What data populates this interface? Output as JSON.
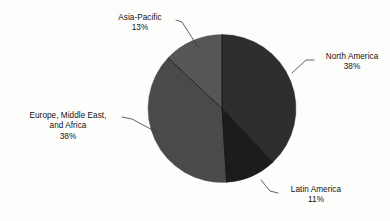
{
  "chart_data": {
    "type": "pie",
    "title": "",
    "subtitle": "",
    "xlabel": "",
    "ylabel": "",
    "legend_position": "none",
    "grid": false,
    "labels_position": "outside-with-leader-lines",
    "start_angle_deg": 0,
    "direction": "clockwise",
    "categories": [
      "North America",
      "Latin America",
      "Europe, Middle East, and Africa",
      "Asia-Pacific"
    ],
    "values": [
      38,
      11,
      38,
      13
    ],
    "value_unit": "%",
    "slices": [
      {
        "name": "North America",
        "label_line_1": "North America",
        "label_line_2": "",
        "value": 38,
        "value_text": "38%",
        "color": "#2e2e2e",
        "start_deg": 0,
        "end_deg": 136.8
      },
      {
        "name": "Latin America",
        "label_line_1": "Latin America",
        "label_line_2": "",
        "value": 11,
        "value_text": "11%",
        "color": "#1c1c1c",
        "start_deg": 136.8,
        "end_deg": 176.4
      },
      {
        "name": "Europe, Middle East, and Africa",
        "label_line_1": "Europe, Middle East,",
        "label_line_2": "and Africa",
        "value": 38,
        "value_text": "38%",
        "color": "#4a4a4a",
        "start_deg": 176.4,
        "end_deg": 313.2
      },
      {
        "name": "Asia-Pacific",
        "label_line_1": "Asia-Pacific",
        "label_line_2": "",
        "value": 13,
        "value_text": "13%",
        "color": "#565656",
        "start_deg": 313.2,
        "end_deg": 360
      }
    ],
    "colors": {
      "north_america": "#2e2e2e",
      "latin_america": "#1c1c1c",
      "europe_middle_east_africa": "#4a4a4a",
      "asia_pacific": "#565656",
      "background": "#fdfdfc",
      "text": "#111111",
      "leader_line": "#3a3a3a"
    }
  }
}
